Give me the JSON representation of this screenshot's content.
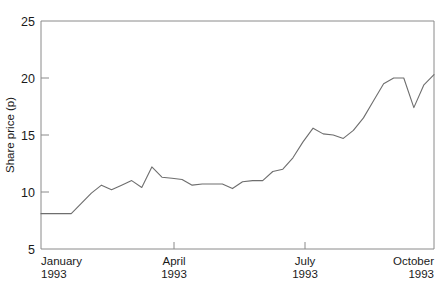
{
  "chart_data": {
    "type": "line",
    "title": "",
    "xlabel": "",
    "ylabel": "Share price (p)",
    "ylim": [
      5,
      25
    ],
    "yticks": [
      5,
      10,
      15,
      20,
      25
    ],
    "ytick_labels": [
      "5",
      "10",
      "15",
      "20",
      "25"
    ],
    "xlim": [
      0,
      39
    ],
    "xticks": [
      0,
      13,
      26,
      39
    ],
    "xtick_labels": [
      {
        "month": "January",
        "year": "1993"
      },
      {
        "month": "April",
        "year": "1993"
      },
      {
        "month": "July",
        "year": "1993"
      },
      {
        "month": "October",
        "year": "1993"
      }
    ],
    "grid": false,
    "legend": "none",
    "series": [
      {
        "name": "Share price",
        "x": [
          0,
          1,
          2,
          3,
          4,
          5,
          6,
          7,
          8,
          9,
          10,
          11,
          12,
          13,
          14,
          15,
          16,
          17,
          18,
          19,
          20,
          21,
          22,
          23,
          24,
          25,
          26,
          27,
          28,
          29,
          30,
          31,
          32,
          33,
          34,
          35,
          36,
          37,
          38,
          39
        ],
        "values": [
          8.1,
          8.1,
          8.1,
          8.1,
          9.0,
          9.9,
          10.6,
          10.2,
          10.6,
          11.0,
          10.4,
          12.2,
          11.3,
          11.2,
          11.1,
          10.6,
          10.7,
          10.7,
          10.7,
          10.3,
          10.9,
          11.0,
          11.0,
          11.8,
          12.0,
          13.0,
          14.4,
          15.6,
          15.1,
          15.0,
          14.7,
          15.4,
          16.5,
          18.0,
          19.5,
          20.0,
          20.0,
          17.4,
          19.4,
          20.3
        ],
        "color": "#6e6e6e"
      }
    ]
  },
  "axes": {
    "y_axis_title": "Share price (p)"
  }
}
